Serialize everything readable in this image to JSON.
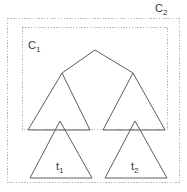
{
  "figure": {
    "type": "phylogenetic-tree-cluster-diagram",
    "background_color": "#ffffff",
    "line_color": "#5d5d5d",
    "box_color": "#b9b9b9",
    "labels": {
      "c1": {
        "base": "C",
        "sub": "1"
      },
      "c2": {
        "base": "C",
        "sub": "2"
      },
      "t1": {
        "base": "t",
        "sub": "1"
      },
      "t2": {
        "base": "t",
        "sub": "2"
      }
    },
    "clusters": [
      {
        "name": "C1",
        "x": 22,
        "y": 27,
        "width": 146,
        "height": 103
      },
      {
        "name": "C2",
        "x": 7,
        "y": 18,
        "width": 173,
        "height": 165
      }
    ],
    "tree": {
      "root_apex": {
        "x": 95,
        "y": 50
      },
      "branches": [
        {
          "from": [
            95,
            50
          ],
          "to": [
            62,
            73
          ]
        },
        {
          "from": [
            95,
            50
          ],
          "to": [
            133,
            73
          ]
        }
      ],
      "subtree_triangles": [
        {
          "name": "left-subtree",
          "apex": [
            62,
            73
          ],
          "base_left": [
            28,
            130
          ],
          "base_right": [
            90,
            130
          ]
        },
        {
          "name": "right-subtree",
          "apex": [
            133,
            73
          ],
          "base_left": [
            103,
            130
          ],
          "base_right": [
            165,
            130
          ]
        }
      ],
      "leaf_triangles": [
        {
          "name": "t1",
          "apex": [
            60,
            121
          ],
          "base_left": [
            30,
            178
          ],
          "base_right": [
            92,
            178
          ]
        },
        {
          "name": "t2",
          "apex": [
            135,
            121
          ],
          "base_left": [
            105,
            178
          ],
          "base_right": [
            167,
            178
          ]
        }
      ]
    }
  }
}
